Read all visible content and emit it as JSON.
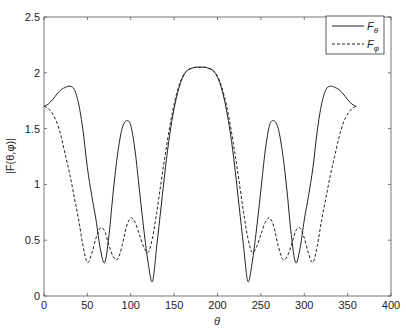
{
  "chart_data": {
    "type": "line",
    "title": "",
    "xlabel": "θ",
    "ylabel": "|F(θ,φ)|",
    "xlim": [
      0,
      400
    ],
    "ylim": [
      0,
      2.5
    ],
    "xticks": [
      0,
      50,
      100,
      150,
      200,
      250,
      300,
      350,
      400
    ],
    "yticks": [
      0,
      0.5,
      1,
      1.5,
      2,
      2.5
    ],
    "xtick_labels": [
      "0",
      "50",
      "100",
      "150",
      "200",
      "250",
      "300",
      "350",
      "400"
    ],
    "ytick_labels": [
      "0",
      "0.5",
      "1",
      "1.5",
      "2",
      "2.5"
    ],
    "grid": false,
    "legend_position": "upper right",
    "x": [
      0,
      5,
      10,
      15,
      20,
      25,
      30,
      35,
      40,
      45,
      50,
      55,
      60,
      65,
      70,
      75,
      80,
      85,
      90,
      95,
      100,
      105,
      110,
      115,
      120,
      125,
      130,
      135,
      140,
      145,
      150,
      155,
      160,
      165,
      170,
      175,
      180,
      185,
      190,
      195,
      200,
      205,
      210,
      215,
      220,
      225,
      230,
      235,
      240,
      245,
      250,
      255,
      260,
      265,
      270,
      275,
      280,
      285,
      290,
      295,
      300,
      305,
      310,
      315,
      320,
      325,
      330,
      335,
      340,
      345,
      350,
      355,
      360
    ],
    "series": [
      {
        "name": "Fθ",
        "style": "solid",
        "values": [
          1.7,
          1.72,
          1.76,
          1.81,
          1.85,
          1.87,
          1.88,
          1.85,
          1.72,
          1.48,
          1.15,
          0.9,
          0.68,
          0.42,
          0.3,
          0.55,
          0.95,
          1.28,
          1.5,
          1.57,
          1.53,
          1.3,
          0.95,
          0.6,
          0.3,
          0.13,
          0.45,
          0.8,
          1.15,
          1.45,
          1.68,
          1.85,
          1.96,
          2.02,
          2.04,
          2.05,
          2.05,
          2.05,
          2.04,
          2.02,
          1.96,
          1.85,
          1.68,
          1.45,
          1.15,
          0.8,
          0.45,
          0.13,
          0.3,
          0.6,
          0.95,
          1.3,
          1.53,
          1.57,
          1.5,
          1.28,
          0.95,
          0.55,
          0.3,
          0.42,
          0.68,
          0.9,
          1.15,
          1.48,
          1.72,
          1.85,
          1.88,
          1.87,
          1.85,
          1.81,
          1.76,
          1.72,
          1.7
        ]
      },
      {
        "name": "Fφ",
        "style": "dashed",
        "values": [
          1.7,
          1.68,
          1.63,
          1.55,
          1.42,
          1.25,
          1.08,
          0.88,
          0.68,
          0.45,
          0.3,
          0.38,
          0.52,
          0.61,
          0.58,
          0.45,
          0.35,
          0.33,
          0.45,
          0.62,
          0.7,
          0.66,
          0.55,
          0.44,
          0.39,
          0.52,
          0.75,
          1.02,
          1.28,
          1.52,
          1.72,
          1.87,
          1.97,
          2.02,
          2.04,
          2.05,
          2.05,
          2.05,
          2.04,
          2.02,
          1.97,
          1.87,
          1.72,
          1.52,
          1.28,
          1.02,
          0.75,
          0.52,
          0.39,
          0.44,
          0.55,
          0.66,
          0.7,
          0.62,
          0.45,
          0.33,
          0.35,
          0.45,
          0.58,
          0.61,
          0.52,
          0.38,
          0.3,
          0.45,
          0.68,
          0.88,
          1.08,
          1.25,
          1.42,
          1.55,
          1.63,
          1.68,
          1.7
        ]
      }
    ]
  },
  "legend": {
    "items": [
      {
        "main": "F",
        "sub": "θ"
      },
      {
        "main": "F",
        "sub": "φ"
      }
    ]
  }
}
